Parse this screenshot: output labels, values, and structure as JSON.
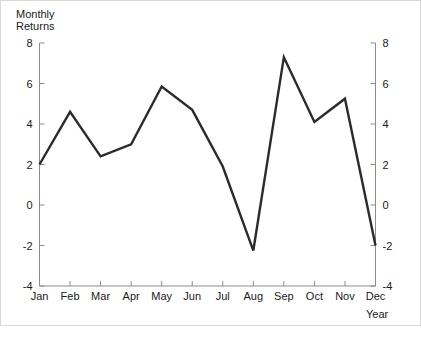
{
  "chart_data": {
    "type": "line",
    "title": "",
    "subtitle": "",
    "ylabel_line1": "Monthly",
    "ylabel_line2": "Returns",
    "xlabel": "Year",
    "categories": [
      "Jan",
      "Feb",
      "Mar",
      "Apr",
      "May",
      "Jun",
      "Jul",
      "Aug",
      "Sep",
      "Oct",
      "Nov",
      "Dec"
    ],
    "values": [
      2.0,
      4.6,
      2.4,
      3.0,
      5.85,
      4.7,
      1.9,
      -2.25,
      7.3,
      4.1,
      5.25,
      -2.0
    ],
    "series": [
      {
        "name": "Monthly Returns",
        "values": [
          2.0,
          4.6,
          2.4,
          3.0,
          5.85,
          4.7,
          1.9,
          -2.25,
          7.3,
          4.1,
          5.25,
          -2.0
        ]
      }
    ],
    "ylim": [
      -4,
      8
    ],
    "yticks": [
      -4,
      -2,
      0,
      2,
      4,
      6,
      8
    ],
    "ytick_labels": [
      "-4",
      "-2",
      "0",
      "2",
      "4",
      "6",
      "8"
    ],
    "ytick_labels_right": [
      "-4",
      "-2",
      "0",
      "2",
      "4",
      "6",
      "8"
    ],
    "xtick_labels": [
      "Jan",
      "Feb",
      "Mar",
      "Apr",
      "May",
      "Jun",
      "Jul",
      "Aug",
      "Sep",
      "Oct",
      "Nov",
      "Dec"
    ],
    "grid": false,
    "legend": false,
    "legend_position": "none",
    "dual_y_axis": true,
    "line_color": "#2b2b2b",
    "axis_color": "#8c8c8c",
    "background_color": "#ffffff"
  }
}
